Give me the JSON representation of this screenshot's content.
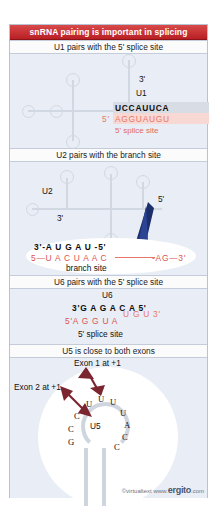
{
  "figure": {
    "title": "snRNA pairing is important in splicing",
    "accent_color": "#b81f24",
    "background_color": "#e9edf5",
    "rna_line_color": "#d2d8e2"
  },
  "sections": [
    {
      "id": "u1",
      "header": "U1 pairs with the  5' splice site",
      "labels": {
        "three_prime": "3'",
        "snrna": "U1",
        "five_prime": "5'"
      },
      "sequences": {
        "snrna_seq": "UCCAUUCA",
        "pre_mrna_seq": "AGGUAUGU",
        "pre_mrna_prefix": "5'",
        "site_label": "5' splice site"
      }
    },
    {
      "id": "u2",
      "header": "U2 pairs with the branch site",
      "labels": {
        "snrna": "U2",
        "three_prime": "3'",
        "five_prime": "5'"
      },
      "sequences": {
        "snrna_line": "3'-A U G A U -5'",
        "pre_mrna_line": "5—U A C U A A C",
        "pre_mrna_tail": "-AG—3'",
        "site_label": "branch site"
      }
    },
    {
      "id": "u6",
      "header": "U6 pairs with the 5' splice site",
      "labels": {
        "snrna": "U6"
      },
      "sequences": {
        "snrna_line": "3'G A G A C A 5'",
        "pre_mrna_line": "5'A G G U A",
        "pre_mrna_raised": "U G U 3'",
        "site_label": "5' splice site"
      }
    },
    {
      "id": "u5",
      "header": "U5 is close to both exons",
      "labels": {
        "exon1": "Exon 1 at +1",
        "exon2": "Exon 2 at +1",
        "snrna": "U5"
      },
      "loop_bases": [
        "C",
        "U",
        "U",
        "U",
        "U",
        "A",
        "C",
        "C",
        "C",
        "G"
      ],
      "arrow_color": "#7b2530"
    }
  ],
  "footer": {
    "copyright": "©virtualtext  www.",
    "brand": "ergito",
    "tld": ".com"
  }
}
